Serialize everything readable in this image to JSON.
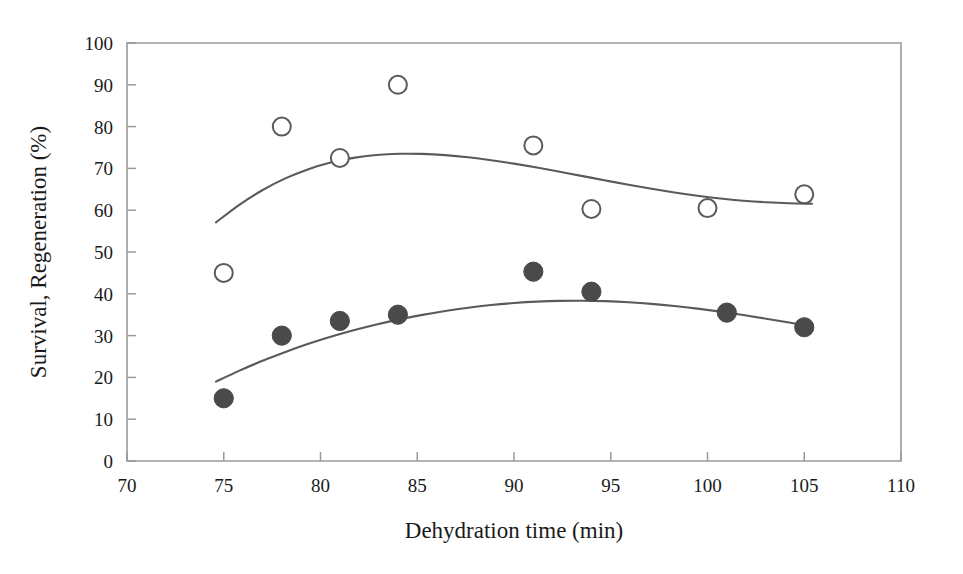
{
  "chart_data": {
    "type": "scatter",
    "title": "",
    "xlabel": "Dehydration time (min)",
    "ylabel": "Survival, Regeneration (%)",
    "xlim": [
      70,
      110
    ],
    "ylim": [
      0,
      100
    ],
    "xticks": [
      70,
      75,
      80,
      85,
      90,
      95,
      100,
      105,
      110
    ],
    "yticks": [
      0,
      10,
      20,
      30,
      40,
      50,
      60,
      70,
      80,
      90,
      100
    ],
    "grid": false,
    "legend": "none",
    "series": [
      {
        "name": "Regeneration",
        "marker": "open-circle",
        "color": "#5a5a5a",
        "fill": "#ffffff",
        "x": [
          75,
          78,
          81,
          84,
          91,
          94,
          100,
          105
        ],
        "values": [
          45,
          80,
          72.5,
          90,
          75.5,
          60.3,
          60.5,
          63.8
        ],
        "fit_curve": "smoothed trend peaking near 83 min at about 88%, declining to about 57.5% at 105 min"
      },
      {
        "name": "Survival",
        "marker": "filled-circle",
        "color": "#4a4a4a",
        "fill": "#4a4a4a",
        "x": [
          75,
          78,
          81,
          84,
          91,
          94,
          101,
          105
        ],
        "values": [
          15,
          30,
          33.5,
          35,
          45.3,
          40.5,
          35.5,
          32
        ],
        "fit_curve": "smoothed trend rising from about 18% at 75 min to a broad maximum near 44% at 89 min, declining to about 31% at 105 min"
      }
    ]
  },
  "axes": {
    "x_tick_labels": [
      "70",
      "75",
      "80",
      "85",
      "90",
      "95",
      "100",
      "105",
      "110"
    ],
    "y_tick_labels": [
      "0",
      "10",
      "20",
      "30",
      "40",
      "50",
      "60",
      "70",
      "80",
      "90",
      "100"
    ],
    "x_axis_title": "Dehydration time (min)",
    "y_axis_title": "Survival, Regeneration (%)"
  }
}
